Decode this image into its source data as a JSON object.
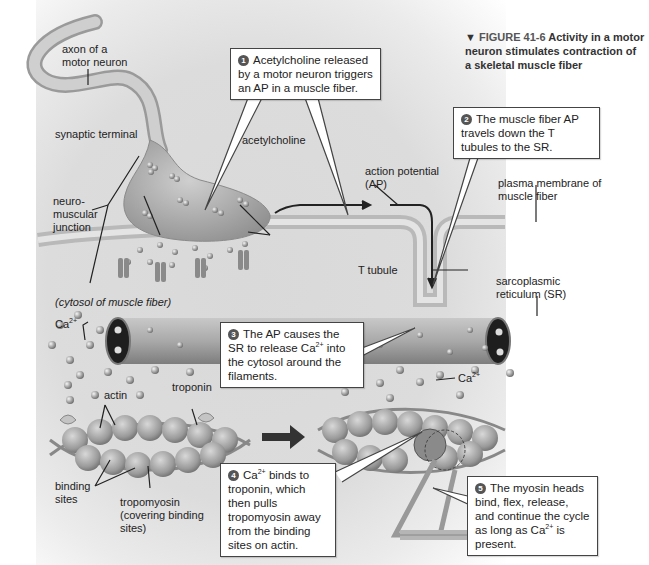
{
  "caption": {
    "marker": "▼",
    "figure_label": "FIGURE 41-6",
    "title": "Activity in a motor neuron stimulates contraction of a skeletal muscle fiber"
  },
  "labels": {
    "axon": "axon of a motor neuron",
    "synaptic_terminal": "synaptic terminal",
    "acetylcholine": "acetylcholine",
    "nmj": "neuro-muscular junction",
    "action_potential": "action potential (AP)",
    "plasma_membrane": "plasma membrane of muscle fiber",
    "t_tubule": "T tubule",
    "sr": "sarcoplasmic reticulum (SR)",
    "cytosol": "(cytosol of muscle fiber)",
    "ca_left": "Ca",
    "ca_right": "Ca",
    "ca_charge": "2+",
    "actin": "actin",
    "troponin": "troponin",
    "binding_sites": "binding sites",
    "tropomyosin": "tropomyosin (covering binding sites)"
  },
  "steps": [
    {
      "number": "1",
      "text_before": "Acetylcholine released by a motor neuron triggers an AP in a muscle fiber.",
      "sup": "",
      "text_after": ""
    },
    {
      "number": "2",
      "text_before": "The muscle fiber AP travels down the T tubules to the SR.",
      "sup": "",
      "text_after": ""
    },
    {
      "number": "3",
      "text_before": "The AP causes the SR to release Ca",
      "sup": "2+",
      "text_after": " into the cytosol around the filaments."
    },
    {
      "number": "4",
      "text_before": "Ca",
      "sup": "2+",
      "text_after": " binds to troponin, which then pulls tropomyosin away from the binding sites on actin."
    },
    {
      "number": "5",
      "text_before": "The myosin heads bind, flex, release, and continue the cycle as long as Ca",
      "sup": "2+",
      "text_after": " is present."
    }
  ],
  "colors": {
    "structure_gray": "#a8a8a8",
    "dark_stroke": "#333333",
    "callout_border": "#444444"
  }
}
